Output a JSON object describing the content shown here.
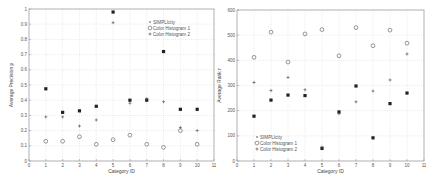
{
  "chart_data": [
    {
      "type": "scatter",
      "title": "",
      "xlabel": "Category ID",
      "ylabel": "Average Precision p",
      "xlim": [
        0,
        11
      ],
      "ylim": [
        0,
        1
      ],
      "xticks": [
        0,
        1,
        2,
        3,
        4,
        5,
        6,
        7,
        8,
        9,
        10,
        11
      ],
      "yticks": [
        0,
        0.1,
        0.2,
        0.3,
        0.4,
        0.5,
        0.6,
        0.7,
        0.8,
        0.9,
        1
      ],
      "grid": true,
      "legend_position": "upper right",
      "x": [
        1,
        2,
        3,
        4,
        5,
        6,
        7,
        8,
        9,
        10
      ],
      "series": [
        {
          "name": "SIMPLIcity",
          "marker": "filled-square",
          "values": [
            0.475,
            0.32,
            0.33,
            0.36,
            0.98,
            0.4,
            0.4,
            0.72,
            0.34,
            0.34
          ]
        },
        {
          "name": "Color Histogram 1",
          "marker": "circle",
          "values": [
            0.13,
            0.13,
            0.16,
            0.11,
            0.14,
            0.17,
            0.11,
            0.09,
            0.2,
            0.11
          ]
        },
        {
          "name": "Color Histogram 2",
          "marker": "plus",
          "values": [
            0.29,
            0.29,
            0.23,
            0.27,
            0.91,
            0.38,
            0.41,
            0.39,
            0.22,
            0.2
          ]
        }
      ]
    },
    {
      "type": "scatter",
      "title": "",
      "xlabel": "Category ID",
      "ylabel": "Average Rank r",
      "xlim": [
        0,
        11
      ],
      "ylim": [
        0,
        600
      ],
      "xticks": [
        0,
        1,
        2,
        3,
        4,
        5,
        6,
        7,
        8,
        9,
        10,
        11
      ],
      "yticks": [
        0,
        100,
        200,
        300,
        400,
        500,
        600
      ],
      "grid": true,
      "legend_position": "lower left",
      "x": [
        1,
        2,
        3,
        4,
        5,
        6,
        7,
        8,
        9,
        10
      ],
      "series": [
        {
          "name": "SIMPLIcity",
          "marker": "filled-square",
          "values": [
            178,
            242,
            262,
            260,
            50,
            195,
            298,
            92,
            228,
            270
          ]
        },
        {
          "name": "Color Histogram 1",
          "marker": "circle",
          "values": [
            412,
            512,
            393,
            505,
            522,
            418,
            530,
            458,
            520,
            468
          ]
        },
        {
          "name": "Color Histogram 2",
          "marker": "plus",
          "values": [
            312,
            280,
            332,
            283,
            55,
            188,
            235,
            278,
            322,
            425
          ]
        }
      ]
    }
  ],
  "legend": {
    "s": "SIMPLIcity",
    "h1": "Color Histogram 1",
    "h2": "Color Histogram 2"
  },
  "left": {
    "xlabel": "Category ID",
    "ylabel": "Average Precision p"
  },
  "right": {
    "xlabel": "Category ID",
    "ylabel": "Average Rank r"
  }
}
